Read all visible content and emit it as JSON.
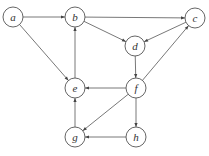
{
  "graph": {
    "directed": true,
    "nodes": [
      {
        "id": "a",
        "label": "a",
        "x": 13,
        "y": 17
      },
      {
        "id": "b",
        "label": "b",
        "x": 75,
        "y": 17
      },
      {
        "id": "c",
        "label": "c",
        "x": 195,
        "y": 18
      },
      {
        "id": "d",
        "label": "d",
        "x": 135,
        "y": 46
      },
      {
        "id": "e",
        "label": "e",
        "x": 75,
        "y": 88
      },
      {
        "id": "f",
        "label": "f",
        "x": 136,
        "y": 88
      },
      {
        "id": "g",
        "label": "g",
        "x": 75,
        "y": 137
      },
      {
        "id": "h",
        "label": "h",
        "x": 136,
        "y": 137
      }
    ],
    "edges": [
      {
        "from": "a",
        "to": "b"
      },
      {
        "from": "a",
        "to": "e"
      },
      {
        "from": "b",
        "to": "c"
      },
      {
        "from": "b",
        "to": "d"
      },
      {
        "from": "c",
        "to": "d"
      },
      {
        "from": "d",
        "to": "f"
      },
      {
        "from": "f",
        "to": "c"
      },
      {
        "from": "f",
        "to": "e"
      },
      {
        "from": "f",
        "to": "g"
      },
      {
        "from": "f",
        "to": "h"
      },
      {
        "from": "e",
        "to": "b"
      },
      {
        "from": "g",
        "to": "e"
      },
      {
        "from": "h",
        "to": "g"
      }
    ]
  }
}
